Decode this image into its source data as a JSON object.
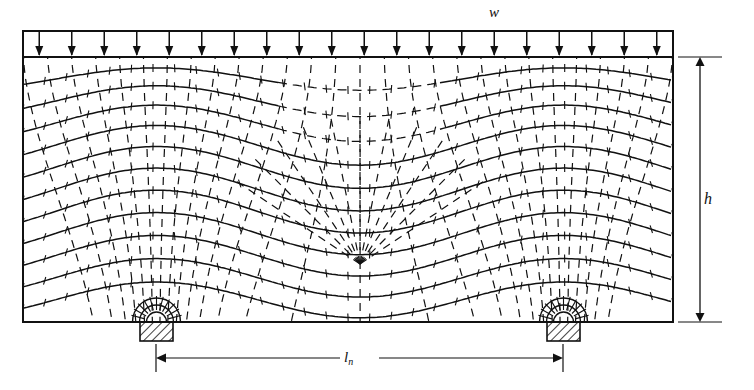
{
  "figure": {
    "kind": "principal-stress-trajectories",
    "solid_lines_meaning": "compression trajectories",
    "dashed_lines_meaning": "tension trajectories",
    "stroke_color": "#111111",
    "background_color": "#ffffff"
  },
  "labels": {
    "load": "w",
    "height": "h",
    "clear_span_symbol": "l",
    "clear_span_subscript": "n"
  },
  "load_band": {
    "arrow_count": 20,
    "x_left": 23,
    "x_right": 673,
    "y_top": 31,
    "y_bottom": 57
  },
  "beam": {
    "x_left": 23,
    "x_right": 673,
    "y_top": 57,
    "y_bottom": 322
  },
  "supports": [
    {
      "name": "left-support",
      "x": 140,
      "y": 322,
      "width": 33,
      "height": 19,
      "hatch": "diagonal"
    },
    {
      "name": "right-support",
      "x": 547,
      "y": 322,
      "width": 33,
      "height": 19,
      "hatch": "diagonal"
    }
  ],
  "dimensions": {
    "height_line": {
      "x": 700,
      "y_top": 57,
      "y_bottom": 322
    },
    "span_line": {
      "y": 358,
      "x_left": 156,
      "x_right": 563
    }
  },
  "chart_data": {
    "type": "line",
    "xlabel": "",
    "ylabel": "",
    "series": [
      {
        "name": "compression trajectories",
        "style": "solid"
      },
      {
        "name": "tension trajectories",
        "style": "dashed"
      }
    ],
    "annotations": [
      "w",
      "h",
      "ln"
    ]
  }
}
